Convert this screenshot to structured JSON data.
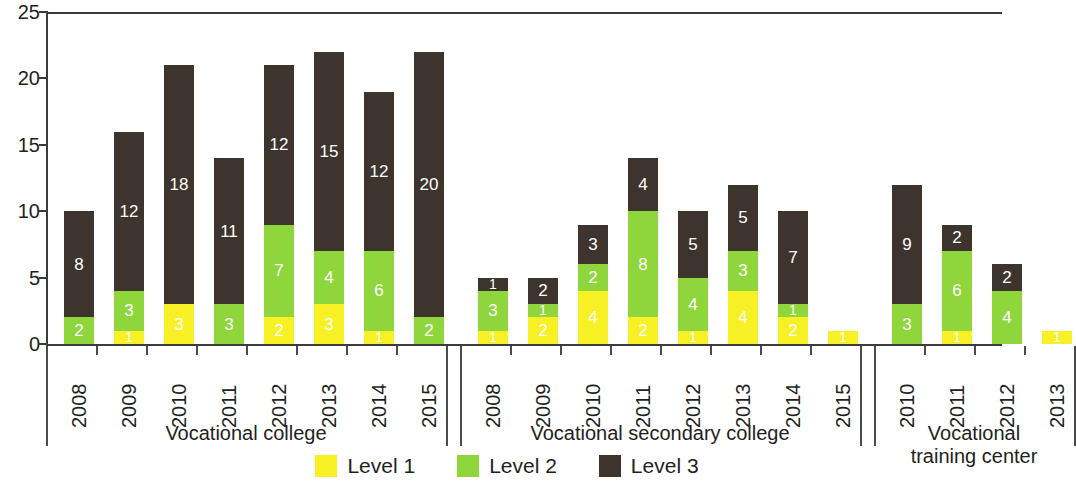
{
  "chart_data": {
    "type": "bar",
    "subtype": "stacked",
    "title": "",
    "xlabel": "",
    "ylabel": "",
    "ylim": [
      0,
      25
    ],
    "y_ticks": [
      0,
      5,
      10,
      15,
      20,
      25
    ],
    "grid": false,
    "legend_position": "bottom-center",
    "series": [
      {
        "name": "Level 1",
        "color": "#f7f024"
      },
      {
        "name": "Level 2",
        "color": "#8ed63c"
      },
      {
        "name": "Level 3",
        "color": "#3d352d"
      }
    ],
    "groups": [
      {
        "label": "Vocational college",
        "categories": [
          "2008",
          "2009",
          "2010",
          "2011",
          "2012",
          "2013",
          "2014",
          "2015"
        ],
        "values": {
          "Level 1": [
            0,
            1,
            3,
            0,
            2,
            3,
            1,
            0
          ],
          "Level 2": [
            2,
            3,
            0,
            3,
            7,
            4,
            6,
            2
          ],
          "Level 3": [
            8,
            12,
            18,
            11,
            12,
            15,
            12,
            20
          ]
        },
        "totals": [
          10,
          16,
          21,
          14,
          21,
          22,
          19,
          22
        ]
      },
      {
        "label": "Vocational secondary college",
        "categories": [
          "2008",
          "2009",
          "2010",
          "2011",
          "2012",
          "2013",
          "2014",
          "2015"
        ],
        "values": {
          "Level 1": [
            1,
            2,
            4,
            2,
            1,
            4,
            2,
            1
          ],
          "Level 2": [
            3,
            1,
            2,
            8,
            4,
            3,
            1,
            0
          ],
          "Level 3": [
            1,
            2,
            3,
            4,
            5,
            5,
            7,
            0
          ]
        },
        "totals": [
          5,
          5,
          9,
          14,
          10,
          12,
          10,
          1
        ]
      },
      {
        "label": "Vocational\ntraining center",
        "categories": [
          "2010",
          "2011",
          "2012",
          "2013"
        ],
        "values": {
          "Level 1": [
            0,
            1,
            0,
            1
          ],
          "Level 2": [
            3,
            6,
            4,
            0
          ],
          "Level 3": [
            9,
            2,
            2,
            0
          ]
        },
        "totals": [
          12,
          9,
          6,
          1
        ]
      }
    ]
  },
  "legend": {
    "items": [
      {
        "label": "Level 1",
        "key": "Level 1"
      },
      {
        "label": "Level 2",
        "key": "Level 2"
      },
      {
        "label": "Level 3",
        "key": "Level 3"
      }
    ]
  }
}
